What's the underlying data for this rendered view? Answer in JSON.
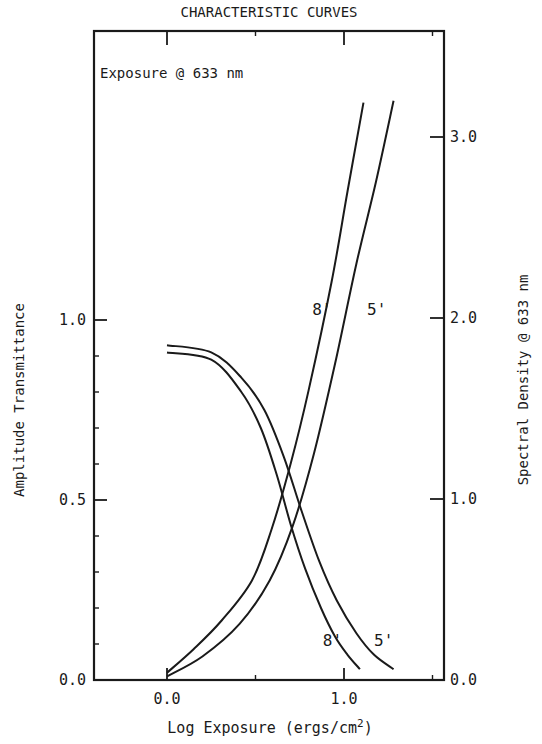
{
  "chart_data": {
    "type": "line",
    "title": "CHARACTERISTIC CURVES",
    "annotation": "Exposure @ 633 nm",
    "xlabel": "Log Exposure (ergs/cm",
    "xlabel_sup": "2",
    "xlabel_close": ")",
    "ylabel_left": "Amplitude Transmittance",
    "ylabel_right": "Spectral Density @ 633 nm",
    "xlim": [
      -0.4,
      1.56
    ],
    "ylim_left": [
      0.0,
      1.8
    ],
    "ylim_right": [
      0.0,
      3.6
    ],
    "x_ticks": [
      {
        "v": 0.0,
        "label": "0.0"
      },
      {
        "v": 1.0,
        "label": "1.0"
      }
    ],
    "x_minor_ticks": [
      0.5,
      1.5
    ],
    "y_left_ticks": [
      {
        "v": 0.0,
        "label": "0.0"
      },
      {
        "v": 0.5,
        "label": "0.5"
      },
      {
        "v": 1.0,
        "label": "1.0"
      }
    ],
    "y_left_minor_ticks": [
      0.1,
      0.2,
      0.3,
      0.4,
      0.6,
      0.7,
      0.8,
      0.9
    ],
    "y_right_ticks": [
      {
        "v": 0.0,
        "label": "0.0"
      },
      {
        "v": 1.0,
        "label": "1.0"
      },
      {
        "v": 2.0,
        "label": "2.0"
      },
      {
        "v": 3.0,
        "label": "3.0"
      }
    ],
    "grid": false,
    "series": [
      {
        "name": "8' density",
        "axis": "right",
        "label": "8'",
        "x": [
          0.0,
          0.15,
          0.31,
          0.48,
          0.59,
          0.7,
          0.8,
          0.93,
          1.02,
          1.11
        ],
        "y": [
          0.04,
          0.17,
          0.33,
          0.55,
          0.83,
          1.2,
          1.6,
          2.2,
          2.7,
          3.19
        ]
      },
      {
        "name": "5' density",
        "axis": "right",
        "label": "5'",
        "x": [
          0.0,
          0.2,
          0.41,
          0.58,
          0.71,
          0.83,
          0.95,
          1.07,
          1.18,
          1.28
        ],
        "y": [
          0.02,
          0.13,
          0.31,
          0.55,
          0.85,
          1.25,
          1.75,
          2.3,
          2.75,
          3.2
        ]
      },
      {
        "name": "5' transmittance",
        "axis": "left",
        "label": "5'",
        "x": [
          0.0,
          0.25,
          0.42,
          0.55,
          0.66,
          0.76,
          0.86,
          0.96,
          1.07,
          1.17,
          1.28
        ],
        "y": [
          0.93,
          0.91,
          0.84,
          0.75,
          0.62,
          0.47,
          0.33,
          0.22,
          0.13,
          0.07,
          0.03
        ]
      },
      {
        "name": "8' transmittance",
        "axis": "left",
        "label": "8'",
        "x": [
          0.0,
          0.25,
          0.42,
          0.53,
          0.62,
          0.7,
          0.78,
          0.87,
          0.95,
          1.02,
          1.09
        ],
        "y": [
          0.91,
          0.89,
          0.8,
          0.7,
          0.57,
          0.43,
          0.31,
          0.2,
          0.12,
          0.07,
          0.03
        ]
      }
    ],
    "curve_labels": [
      {
        "text": "8'",
        "x": 0.82,
        "y_left": 1.0
      },
      {
        "text": "5'",
        "x": 1.13,
        "y_left": 1.0
      },
      {
        "text": "8'",
        "x": 0.88,
        "y_left": 0.08
      },
      {
        "text": "5'",
        "x": 1.17,
        "y_left": 0.08
      }
    ]
  }
}
